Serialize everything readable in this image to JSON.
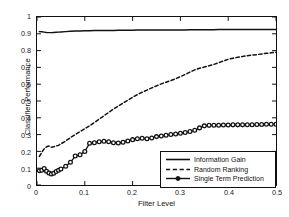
{
  "chart_data": {
    "type": "line",
    "title": "",
    "xlabel": "Filter Level",
    "ylabel": "Classifier Performance",
    "xlim": [
      0,
      0.5
    ],
    "ylim": [
      0,
      1
    ],
    "xticks": [
      "0",
      "0.1",
      "0.2",
      "0.3",
      "0.4",
      "0.5"
    ],
    "xtick_values": [
      0,
      0.1,
      0.2,
      0.3,
      0.4,
      0.5
    ],
    "yticks": [
      "0",
      "0.1",
      "0.2",
      "0.3",
      "0.4",
      "0.5",
      "0.6",
      "0.7",
      "0.8",
      "0.9",
      "1"
    ],
    "ytick_values": [
      0,
      0.1,
      0.2,
      0.3,
      0.4,
      0.5,
      0.6,
      0.7,
      0.8,
      0.9,
      1.0
    ],
    "grid": false,
    "legend_position": "lower right",
    "x": [
      0.005,
      0.01,
      0.015,
      0.02,
      0.025,
      0.03,
      0.035,
      0.04,
      0.045,
      0.05,
      0.06,
      0.07,
      0.08,
      0.09,
      0.1,
      0.11,
      0.12,
      0.13,
      0.14,
      0.15,
      0.16,
      0.17,
      0.18,
      0.19,
      0.2,
      0.21,
      0.22,
      0.23,
      0.24,
      0.25,
      0.26,
      0.27,
      0.28,
      0.29,
      0.3,
      0.31,
      0.32,
      0.33,
      0.34,
      0.35,
      0.36,
      0.37,
      0.38,
      0.39,
      0.4,
      0.41,
      0.42,
      0.43,
      0.44,
      0.45,
      0.46,
      0.47,
      0.48,
      0.49,
      0.5
    ],
    "series": [
      {
        "name": "Information Gain",
        "style": "solid",
        "marker": "none",
        "color": "#111111",
        "values": [
          0.913,
          0.912,
          0.91,
          0.908,
          0.907,
          0.907,
          0.908,
          0.909,
          0.91,
          0.911,
          0.913,
          0.915,
          0.916,
          0.917,
          0.918,
          0.918,
          0.919,
          0.919,
          0.92,
          0.92,
          0.92,
          0.921,
          0.921,
          0.921,
          0.921,
          0.922,
          0.922,
          0.922,
          0.922,
          0.922,
          0.923,
          0.923,
          0.923,
          0.923,
          0.923,
          0.923,
          0.924,
          0.924,
          0.924,
          0.924,
          0.924,
          0.924,
          0.925,
          0.925,
          0.925,
          0.925,
          0.925,
          0.925,
          0.925,
          0.926,
          0.926,
          0.926,
          0.926,
          0.926,
          0.926
        ]
      },
      {
        "name": "Random Ranking",
        "style": "dashed",
        "marker": "none",
        "color": "#111111",
        "values": [
          0.17,
          0.195,
          0.215,
          0.228,
          0.232,
          0.225,
          0.228,
          0.232,
          0.236,
          0.245,
          0.262,
          0.282,
          0.3,
          0.318,
          0.335,
          0.352,
          0.372,
          0.392,
          0.412,
          0.432,
          0.452,
          0.47,
          0.488,
          0.505,
          0.522,
          0.538,
          0.552,
          0.565,
          0.578,
          0.59,
          0.602,
          0.612,
          0.622,
          0.632,
          0.645,
          0.658,
          0.672,
          0.685,
          0.695,
          0.702,
          0.71,
          0.718,
          0.728,
          0.738,
          0.748,
          0.755,
          0.76,
          0.765,
          0.77,
          0.773,
          0.776,
          0.78,
          0.784,
          0.787,
          0.79
        ]
      },
      {
        "name": "Single Term Prediction",
        "style": "solid",
        "marker": "circle",
        "color": "#111111",
        "values": [
          0.085,
          0.088,
          0.098,
          0.082,
          0.072,
          0.065,
          0.07,
          0.08,
          0.088,
          0.095,
          0.112,
          0.135,
          0.172,
          0.18,
          0.2,
          0.248,
          0.252,
          0.258,
          0.26,
          0.258,
          0.252,
          0.25,
          0.255,
          0.262,
          0.27,
          0.275,
          0.278,
          0.275,
          0.28,
          0.288,
          0.292,
          0.296,
          0.3,
          0.303,
          0.308,
          0.312,
          0.318,
          0.326,
          0.34,
          0.352,
          0.355,
          0.356,
          0.356,
          0.357,
          0.357,
          0.358,
          0.358,
          0.358,
          0.359,
          0.359,
          0.36,
          0.36,
          0.361,
          0.361,
          0.362
        ]
      }
    ]
  },
  "legend": {
    "items": [
      {
        "label": "Information Gain"
      },
      {
        "label": "Random Ranking"
      },
      {
        "label": "Single Term Prediction"
      }
    ]
  }
}
